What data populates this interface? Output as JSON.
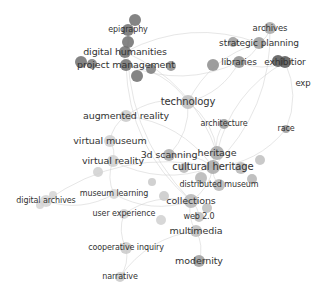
{
  "network": {
    "type": "keyword-cooccurrence-network",
    "colors": {
      "background": "#ffffff",
      "edge": "#cfcfcf",
      "label": "#333333"
    },
    "nodes": [
      {
        "id": "epigraphy",
        "label": "epigraphy",
        "x": 128,
        "y": 30,
        "r": 6,
        "color": "#6e6e6e",
        "fs": 8
      },
      {
        "id": "digital-humanities",
        "label": "digital humanities",
        "x": 125,
        "y": 52,
        "r": 6,
        "color": "#6e6e6e",
        "fs": 9.5
      },
      {
        "id": "project-management",
        "label": "project management",
        "x": 126,
        "y": 65,
        "r": 6,
        "color": "#6e6e6e",
        "fs": 9.5
      },
      {
        "id": "archives",
        "label": "archives",
        "x": 270,
        "y": 28,
        "r": 6,
        "color": "#a6a6a6",
        "fs": 8.5
      },
      {
        "id": "strategic-planning",
        "label": "strategic planning",
        "x": 259,
        "y": 43,
        "r": 6,
        "color": "#9a9a9a",
        "fs": 9
      },
      {
        "id": "libraries",
        "label": "libraries",
        "x": 239,
        "y": 62,
        "r": 6,
        "color": "#8c8c8c",
        "fs": 9
      },
      {
        "id": "exhibition",
        "label": "exhibitior",
        "x": 285,
        "y": 62,
        "r": 6,
        "color": "#555555",
        "fs": 9
      },
      {
        "id": "exp",
        "label": "exp",
        "x": 303,
        "y": 83,
        "r": 0,
        "color": "#999999",
        "fs": 8.5
      },
      {
        "id": "technology",
        "label": "technology",
        "x": 188,
        "y": 102,
        "r": 7,
        "color": "#bdbdbd",
        "fs": 10
      },
      {
        "id": "augmented-reality",
        "label": "augmented reality",
        "x": 126,
        "y": 116,
        "r": 6,
        "color": "#c9c9c9",
        "fs": 9.5
      },
      {
        "id": "architecture",
        "label": "architecture",
        "x": 224,
        "y": 124,
        "r": 5,
        "color": "#9a9a9a",
        "fs": 8
      },
      {
        "id": "race",
        "label": "race",
        "x": 286,
        "y": 129,
        "r": 4,
        "color": "#9a9a9a",
        "fs": 8
      },
      {
        "id": "virtual-museum",
        "label": "virtual museum",
        "x": 110,
        "y": 141,
        "r": 6,
        "color": "#cfcfcf",
        "fs": 9.5
      },
      {
        "id": "virtual-reality",
        "label": "virtual reality",
        "x": 113,
        "y": 161,
        "r": 6,
        "color": "#cfcfcf",
        "fs": 9.5
      },
      {
        "id": "3d-scanning",
        "label": "3d scanning",
        "x": 169,
        "y": 155,
        "r": 6,
        "color": "#a8a8a8",
        "fs": 9.5
      },
      {
        "id": "heritage",
        "label": "heritage",
        "x": 217,
        "y": 153,
        "r": 7,
        "color": "#a8a8a8",
        "fs": 9.5
      },
      {
        "id": "cultural-heritage",
        "label": "cultural heritage",
        "x": 213,
        "y": 167,
        "r": 7,
        "color": "#a8a8a8",
        "fs": 10
      },
      {
        "id": "distributed-museum",
        "label": "distributed museum",
        "x": 219,
        "y": 185,
        "r": 6,
        "color": "#b5b5b5",
        "fs": 8
      },
      {
        "id": "museum-learning",
        "label": "museum learning",
        "x": 114,
        "y": 194,
        "r": 5,
        "color": "#d5d5d5",
        "fs": 8
      },
      {
        "id": "digital-archives",
        "label": "digital archives",
        "x": 46,
        "y": 201,
        "r": 6,
        "color": "#d5d5d5",
        "fs": 8
      },
      {
        "id": "collections",
        "label": "collections",
        "x": 191,
        "y": 201,
        "r": 7,
        "color": "#b5b5b5",
        "fs": 9.5
      },
      {
        "id": "user-experience",
        "label": "user experience",
        "x": 124,
        "y": 214,
        "r": 5,
        "color": "#d5d5d5",
        "fs": 8
      },
      {
        "id": "web-2-0",
        "label": "web 2.0",
        "x": 199,
        "y": 217,
        "r": 5,
        "color": "#bdbdbd",
        "fs": 8
      },
      {
        "id": "multimedia",
        "label": "multimedia",
        "x": 196,
        "y": 231,
        "r": 6,
        "color": "#bdbdbd",
        "fs": 9.5
      },
      {
        "id": "cooperative-inquiry",
        "label": "cooperative inquiry",
        "x": 126,
        "y": 248,
        "r": 6,
        "color": "#c9c9c9",
        "fs": 8
      },
      {
        "id": "modernity",
        "label": "modernity",
        "x": 199,
        "y": 261,
        "r": 6,
        "color": "#9a9a9a",
        "fs": 9.5
      },
      {
        "id": "narrative",
        "label": "narrative",
        "x": 120,
        "y": 277,
        "r": 5,
        "color": "#c9c9c9",
        "fs": 8
      }
    ],
    "extra_dots": [
      {
        "x": 135,
        "y": 20,
        "r": 6,
        "color": "#6e6e6e"
      },
      {
        "x": 128,
        "y": 42,
        "r": 6,
        "color": "#6e6e6e"
      },
      {
        "x": 81,
        "y": 62,
        "r": 6,
        "color": "#6e6e6e"
      },
      {
        "x": 92,
        "y": 64,
        "r": 5,
        "color": "#7a7a7a"
      },
      {
        "x": 137,
        "y": 76,
        "r": 6,
        "color": "#6e6e6e"
      },
      {
        "x": 151,
        "y": 69,
        "r": 5,
        "color": "#7a7a7a"
      },
      {
        "x": 171,
        "y": 66,
        "r": 5,
        "color": "#8c8c8c"
      },
      {
        "x": 213,
        "y": 65,
        "r": 6,
        "color": "#8c8c8c"
      },
      {
        "x": 233,
        "y": 42,
        "r": 5,
        "color": "#9a9a9a"
      },
      {
        "x": 278,
        "y": 61,
        "r": 6,
        "color": "#555555"
      },
      {
        "x": 241,
        "y": 168,
        "r": 6,
        "color": "#b5b5b5"
      },
      {
        "x": 252,
        "y": 179,
        "r": 5,
        "color": "#b5b5b5"
      },
      {
        "x": 260,
        "y": 160,
        "r": 5,
        "color": "#c0c0c0"
      },
      {
        "x": 201,
        "y": 178,
        "r": 6,
        "color": "#b5b5b5"
      },
      {
        "x": 184,
        "y": 168,
        "r": 5,
        "color": "#b5b5b5"
      },
      {
        "x": 207,
        "y": 208,
        "r": 5,
        "color": "#bdbdbd"
      },
      {
        "x": 164,
        "y": 196,
        "r": 5,
        "color": "#c9c9c9"
      },
      {
        "x": 161,
        "y": 220,
        "r": 5,
        "color": "#d0d0d0"
      },
      {
        "x": 53,
        "y": 195,
        "r": 4,
        "color": "#d5d5d5"
      },
      {
        "x": 40,
        "y": 205,
        "r": 4,
        "color": "#d5d5d5"
      },
      {
        "x": 98,
        "y": 172,
        "r": 5,
        "color": "#d0d0d0"
      },
      {
        "x": 152,
        "y": 182,
        "r": 4,
        "color": "#c9c9c9"
      }
    ],
    "edges": [
      [
        "epigraphy",
        "digital-humanities"
      ],
      [
        "digital-humanities",
        "project-management"
      ],
      [
        "project-management",
        "technology"
      ],
      [
        "project-management",
        "libraries"
      ],
      [
        "digital-humanities",
        "strategic-planning"
      ],
      [
        "strategic-planning",
        "archives"
      ],
      [
        "strategic-planning",
        "libraries"
      ],
      [
        "libraries",
        "exhibition"
      ],
      [
        "exhibition",
        "race"
      ],
      [
        "technology",
        "augmented-reality"
      ],
      [
        "technology",
        "heritage"
      ],
      [
        "technology",
        "libraries"
      ],
      [
        "technology",
        "3d-scanning"
      ],
      [
        "augmented-reality",
        "virtual-museum"
      ],
      [
        "virtual-museum",
        "virtual-reality"
      ],
      [
        "virtual-reality",
        "museum-learning"
      ],
      [
        "museum-learning",
        "digital-archives"
      ],
      [
        "museum-learning",
        "collections"
      ],
      [
        "user-experience",
        "collections"
      ],
      [
        "user-experience",
        "cooperative-inquiry"
      ],
      [
        "cooperative-inquiry",
        "narrative"
      ],
      [
        "collections",
        "multimedia"
      ],
      [
        "multimedia",
        "modernity"
      ],
      [
        "collections",
        "cultural-heritage"
      ],
      [
        "cultural-heritage",
        "heritage"
      ],
      [
        "cultural-heritage",
        "distributed-museum"
      ],
      [
        "heritage",
        "architecture"
      ],
      [
        "cultural-heritage",
        "race"
      ],
      [
        "3d-scanning",
        "cultural-heritage"
      ],
      [
        "web-2-0",
        "collections"
      ],
      [
        "archives",
        "cultural-heritage"
      ],
      [
        "epigraphy",
        "collections"
      ],
      [
        "digital-humanities",
        "heritage"
      ],
      [
        "strategic-planning",
        "technology"
      ],
      [
        "digital-archives",
        "cultural-heritage"
      ],
      [
        "exhibition",
        "heritage"
      ],
      [
        "augmented-reality",
        "cultural-heritage"
      ],
      [
        "virtual-reality",
        "cultural-heritage"
      ],
      [
        "narrative",
        "multimedia"
      ],
      [
        "project-management",
        "collections"
      ]
    ]
  }
}
